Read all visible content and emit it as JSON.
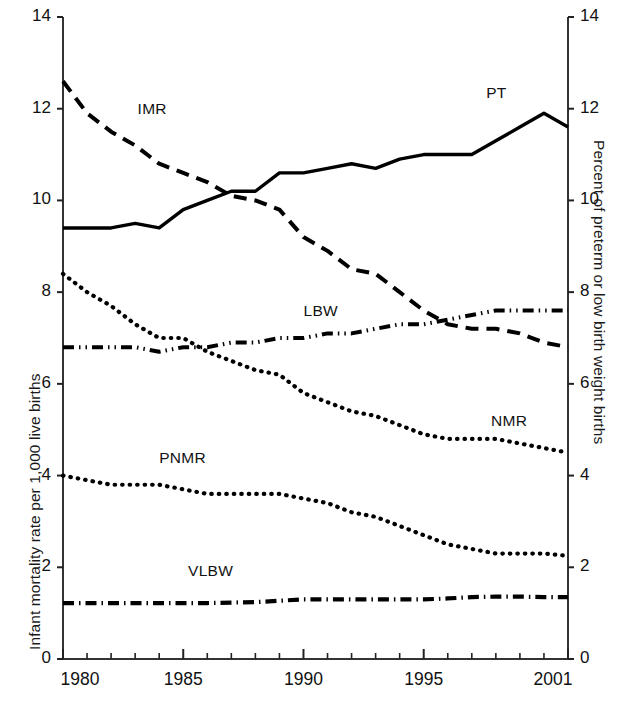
{
  "chart_data": {
    "type": "line",
    "title": "",
    "subtitle": "",
    "xlabel": "",
    "ylabel": "Infant mortality rate per 1,000 live births",
    "ylabel_right": "Percent of preterm or low birth weight births",
    "xlim": [
      1980,
      2001
    ],
    "ylim": [
      0,
      14
    ],
    "ylim_right": [
      0,
      14
    ],
    "grid": false,
    "legend_position": "inline-annotations",
    "x_tick_labels": [
      "1980",
      "1985",
      "1990",
      "1995",
      "2001"
    ],
    "x_tick_values": [
      1980,
      1985,
      1990,
      1995,
      2001
    ],
    "x_minor_ticks": [
      1981,
      1982,
      1983,
      1984,
      1986,
      1987,
      1988,
      1989,
      1991,
      1992,
      1993,
      1994,
      1996,
      1997,
      1998,
      1999,
      2000
    ],
    "y_tick_labels": [
      "0",
      "2",
      "4",
      "6",
      "8",
      "10",
      "12",
      "14"
    ],
    "y_tick_values": [
      0,
      2,
      4,
      6,
      8,
      10,
      12,
      14
    ],
    "y_tick_labels_right": [
      "0",
      "2",
      "4",
      "6",
      "8",
      "10",
      "12",
      "14"
    ],
    "y_tick_values_right": [
      0,
      2,
      4,
      6,
      8,
      10,
      12,
      14
    ],
    "x": [
      1980,
      1981,
      1982,
      1983,
      1984,
      1985,
      1986,
      1987,
      1988,
      1989,
      1990,
      1991,
      1992,
      1993,
      1994,
      1995,
      1996,
      1997,
      1998,
      1999,
      2000,
      2001
    ],
    "series": [
      {
        "name": "PT",
        "label": "PT",
        "axis": "right",
        "style": "solid",
        "color": "#000000",
        "values": [
          9.4,
          9.4,
          9.4,
          9.5,
          9.4,
          9.8,
          10.0,
          10.2,
          10.2,
          10.6,
          10.6,
          10.7,
          10.8,
          10.7,
          10.9,
          11.0,
          11.0,
          11.0,
          11.3,
          11.6,
          11.9,
          11.6
        ]
      },
      {
        "name": "IMR",
        "label": "IMR",
        "axis": "left",
        "style": "dashed",
        "color": "#000000",
        "values": [
          12.6,
          11.9,
          11.5,
          11.2,
          10.8,
          10.6,
          10.4,
          10.1,
          10.0,
          9.8,
          9.2,
          8.9,
          8.5,
          8.4,
          8.0,
          7.6,
          7.3,
          7.2,
          7.2,
          7.1,
          6.9,
          6.8
        ]
      },
      {
        "name": "NMR",
        "label": "NMR",
        "axis": "left",
        "style": "dotted",
        "color": "#000000",
        "values": [
          8.4,
          8.0,
          7.7,
          7.3,
          7.0,
          7.0,
          6.7,
          6.5,
          6.3,
          6.2,
          5.8,
          5.6,
          5.4,
          5.3,
          5.1,
          4.9,
          4.8,
          4.8,
          4.8,
          4.7,
          4.6,
          4.5
        ]
      },
      {
        "name": "LBW",
        "label": "LBW",
        "axis": "right",
        "style": "dash-dot-dot",
        "color": "#000000",
        "values": [
          6.8,
          6.8,
          6.8,
          6.8,
          6.7,
          6.8,
          6.8,
          6.9,
          6.9,
          7.0,
          7.0,
          7.1,
          7.1,
          7.2,
          7.3,
          7.3,
          7.4,
          7.5,
          7.6,
          7.6,
          7.6,
          7.6
        ]
      },
      {
        "name": "PNMR",
        "label": "PNMR",
        "axis": "left",
        "style": "dotted",
        "color": "#000000",
        "values": [
          4.0,
          3.9,
          3.8,
          3.8,
          3.8,
          3.7,
          3.6,
          3.6,
          3.6,
          3.6,
          3.5,
          3.4,
          3.2,
          3.1,
          2.9,
          2.7,
          2.5,
          2.4,
          2.3,
          2.3,
          2.3,
          2.25
        ]
      },
      {
        "name": "VLBW",
        "label": "VLBW",
        "axis": "right",
        "style": "dash-dot",
        "color": "#000000",
        "values": [
          1.22,
          1.22,
          1.22,
          1.22,
          1.22,
          1.22,
          1.22,
          1.23,
          1.24,
          1.27,
          1.3,
          1.3,
          1.3,
          1.3,
          1.3,
          1.3,
          1.32,
          1.35,
          1.36,
          1.36,
          1.35,
          1.35
        ]
      }
    ],
    "annotations": [
      {
        "text": "IMR",
        "x": 1983.1,
        "y_axis": "left",
        "y": 11.95
      },
      {
        "text": "PT",
        "x": 1997.6,
        "y_axis": "right",
        "y": 12.3
      },
      {
        "text": "LBW",
        "x": 1990.0,
        "y_axis": "right",
        "y": 7.55
      },
      {
        "text": "NMR",
        "x": 1997.8,
        "y_axis": "left",
        "y": 5.15
      },
      {
        "text": "PNMR",
        "x": 1984.0,
        "y_axis": "left",
        "y": 4.35
      },
      {
        "text": "VLBW",
        "x": 1985.2,
        "y_axis": "right",
        "y": 1.88
      }
    ]
  }
}
